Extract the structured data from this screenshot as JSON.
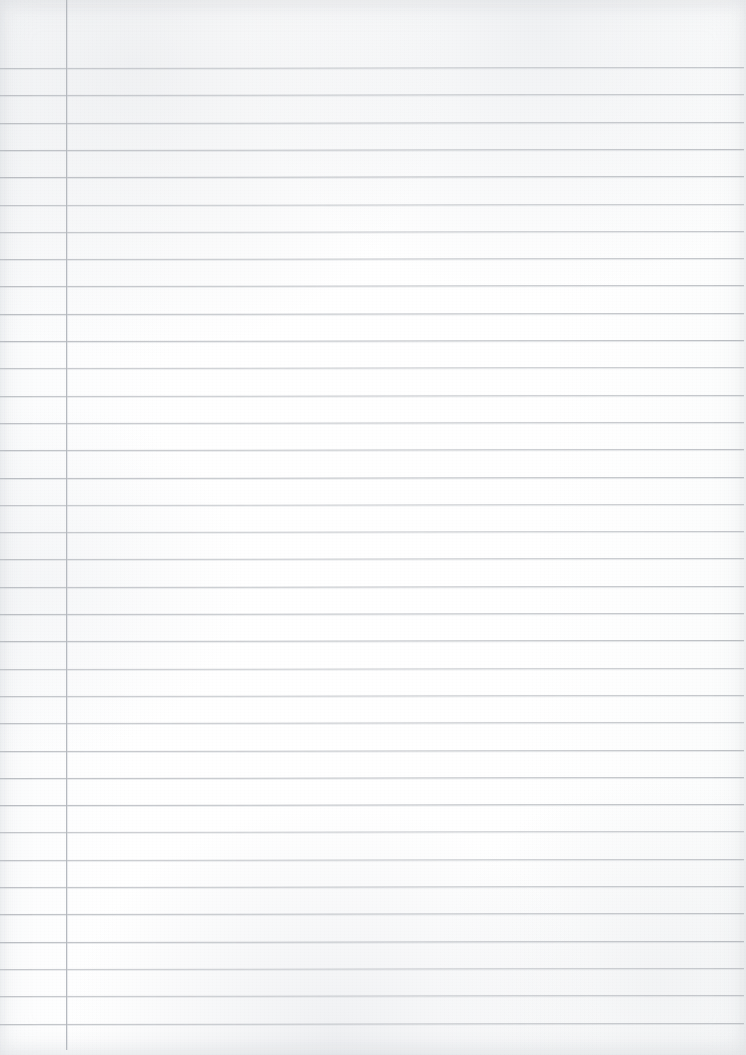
{
  "document": {
    "kind": "scanned-ruled-notebook-page",
    "title": "Blank Lined Notebook Page",
    "page_width": 746,
    "page_height": 1055,
    "text_content": "",
    "handwriting_present": false,
    "is_blank": true
  },
  "paper": {
    "background_color": "#fdfdfd",
    "edge_tone_color": "#f4f5f6",
    "texture": "scan-grain"
  },
  "ruling": {
    "rule_color": "#b9bcc1",
    "margin_rule_color": "#b2b6bc",
    "rule_thickness_px": 1,
    "line_spacing_px": 27.3,
    "first_rule_y": 68,
    "last_rule_y": 1023,
    "rule_count": 36,
    "rule_left_x": 0,
    "rule_right_x": 744,
    "rule_skew_deg": -0.08,
    "margin_rule_x": 66,
    "margin_rule_top_y": 0,
    "margin_rule_bottom_y": 1050,
    "horizontal_rules": [
      {
        "index": 1,
        "y": 68.0,
        "left_x": 0,
        "right_x": 744
      },
      {
        "index": 2,
        "y": 95.3,
        "left_x": 0,
        "right_x": 744
      },
      {
        "index": 3,
        "y": 122.6,
        "left_x": 0,
        "right_x": 744
      },
      {
        "index": 4,
        "y": 149.9,
        "left_x": 0,
        "right_x": 744
      },
      {
        "index": 5,
        "y": 177.2,
        "left_x": 0,
        "right_x": 744
      },
      {
        "index": 6,
        "y": 204.5,
        "left_x": 0,
        "right_x": 744
      },
      {
        "index": 7,
        "y": 231.8,
        "left_x": 0,
        "right_x": 744
      },
      {
        "index": 8,
        "y": 259.1,
        "left_x": 0,
        "right_x": 744
      },
      {
        "index": 9,
        "y": 286.4,
        "left_x": 0,
        "right_x": 744
      },
      {
        "index": 10,
        "y": 313.7,
        "left_x": 0,
        "right_x": 744
      },
      {
        "index": 11,
        "y": 341.0,
        "left_x": 0,
        "right_x": 744
      },
      {
        "index": 12,
        "y": 368.3,
        "left_x": 0,
        "right_x": 744
      },
      {
        "index": 13,
        "y": 395.6,
        "left_x": 0,
        "right_x": 744
      },
      {
        "index": 14,
        "y": 422.9,
        "left_x": 0,
        "right_x": 744
      },
      {
        "index": 15,
        "y": 450.2,
        "left_x": 0,
        "right_x": 744
      },
      {
        "index": 16,
        "y": 477.5,
        "left_x": 0,
        "right_x": 744
      },
      {
        "index": 17,
        "y": 504.8,
        "left_x": 0,
        "right_x": 744
      },
      {
        "index": 18,
        "y": 532.1,
        "left_x": 0,
        "right_x": 744
      },
      {
        "index": 19,
        "y": 559.4,
        "left_x": 0,
        "right_x": 744
      },
      {
        "index": 20,
        "y": 586.7,
        "left_x": 0,
        "right_x": 744
      },
      {
        "index": 21,
        "y": 614.0,
        "left_x": 0,
        "right_x": 744
      },
      {
        "index": 22,
        "y": 641.3,
        "left_x": 0,
        "right_x": 744
      },
      {
        "index": 23,
        "y": 668.6,
        "left_x": 0,
        "right_x": 744
      },
      {
        "index": 24,
        "y": 695.9,
        "left_x": 0,
        "right_x": 744
      },
      {
        "index": 25,
        "y": 723.2,
        "left_x": 0,
        "right_x": 744
      },
      {
        "index": 26,
        "y": 750.5,
        "left_x": 0,
        "right_x": 744
      },
      {
        "index": 27,
        "y": 777.8,
        "left_x": 0,
        "right_x": 744
      },
      {
        "index": 28,
        "y": 805.1,
        "left_x": 0,
        "right_x": 744
      },
      {
        "index": 29,
        "y": 832.4,
        "left_x": 0,
        "right_x": 744
      },
      {
        "index": 30,
        "y": 859.7,
        "left_x": 0,
        "right_x": 744
      },
      {
        "index": 31,
        "y": 887.0,
        "left_x": 0,
        "right_x": 744
      },
      {
        "index": 32,
        "y": 914.3,
        "left_x": 0,
        "right_x": 744
      },
      {
        "index": 33,
        "y": 941.6,
        "left_x": 0,
        "right_x": 744
      },
      {
        "index": 34,
        "y": 968.9,
        "left_x": 0,
        "right_x": 744
      },
      {
        "index": 35,
        "y": 996.2,
        "left_x": 0,
        "right_x": 744
      },
      {
        "index": 36,
        "y": 1023.5,
        "left_x": 0,
        "right_x": 744
      }
    ]
  }
}
